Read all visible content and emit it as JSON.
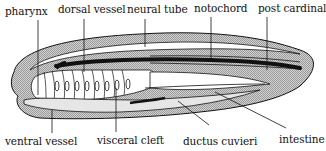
{
  "diagram": {
    "colors": {
      "ink": "#111111",
      "hatch_fill": "#bdbdbd",
      "light_fill": "#e6e6e6",
      "background": "#ffffff"
    },
    "labels_top": [
      {
        "id": "pharynx",
        "text": "pharynx"
      },
      {
        "id": "dorsal-vessel",
        "text": "dorsal vessel"
      },
      {
        "id": "neural-tube",
        "text": "neural tube"
      },
      {
        "id": "notochord",
        "text": "notochord"
      },
      {
        "id": "post-cardinal",
        "text": "post cardinal"
      }
    ],
    "labels_bottom": [
      {
        "id": "ventral-vessel",
        "text": "ventral vessel"
      },
      {
        "id": "visceral-cleft",
        "text": "visceral cleft"
      },
      {
        "id": "ductus-cuvieri",
        "text": "ductus cuvieri"
      },
      {
        "id": "intestine",
        "text": "intestine"
      }
    ]
  }
}
